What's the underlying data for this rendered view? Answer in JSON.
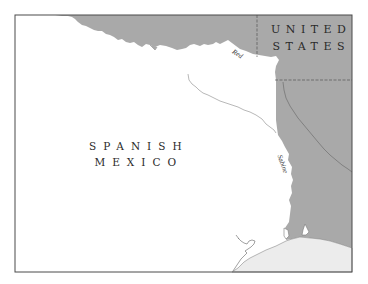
{
  "map": {
    "colors": {
      "background": "#ffffff",
      "us_land": "#a9a9a9",
      "sea": "#ececec",
      "frame": "#4a4a4a",
      "river_light": "#f4f4f4",
      "river_dark": "#6e6e6e",
      "boundary_dash": "#555555"
    },
    "regions": {
      "spanish_mexico": {
        "line1": "SPANISH",
        "line2": "MEXICO"
      },
      "united_states": {
        "line1": "UNITED",
        "line2": "STATES"
      }
    },
    "rivers": {
      "red": "Red",
      "sabine": "Sabine"
    }
  }
}
